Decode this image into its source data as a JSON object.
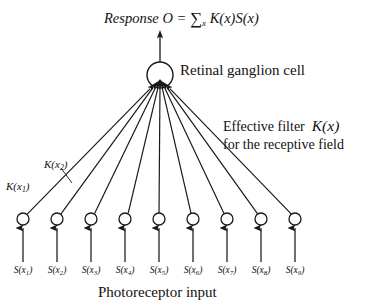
{
  "figure": {
    "title_equation": {
      "prefix": "Response",
      "output_symbol": "O",
      "equals": "=",
      "sum_symbol": "∑",
      "sum_index": "x",
      "kernel": "K(x)",
      "signal": "S(x)",
      "full_text": "Response O = ∑x K(x)S(x)"
    },
    "ganglion_cell_label": "Retinal ganglion cell",
    "effective_filter": {
      "line1_text": "Effective filter",
      "line1_symbol": "K(x)",
      "line2_text": "for the receptive field"
    },
    "weight_labels": [
      {
        "name": "K(x1)",
        "base": "K(x",
        "sub": "1",
        "close": ")"
      },
      {
        "name": "K(x2)",
        "base": "K(x",
        "sub": "2",
        "close": ")"
      }
    ],
    "photoreceptor_input_label": "Photoreceptor input",
    "photoreceptors": [
      {
        "index": 1,
        "label_base": "S(x",
        "label_sub": "1",
        "label_close": ")",
        "label": "S(x1)",
        "cx": 23
      },
      {
        "index": 2,
        "label_base": "S(x",
        "label_sub": "2",
        "label_close": ")",
        "label": "S(x2)",
        "cx": 57
      },
      {
        "index": 3,
        "label_base": "S(x",
        "label_sub": "3",
        "label_close": ")",
        "label": "S(x3)",
        "cx": 91
      },
      {
        "index": 4,
        "label_base": "S(x",
        "label_sub": "4",
        "label_close": ")",
        "label": "S(x4)",
        "cx": 125
      },
      {
        "index": 5,
        "label_base": "S(x",
        "label_sub": "5",
        "label_close": ")",
        "label": "S(x5)",
        "cx": 159
      },
      {
        "index": 6,
        "label_base": "S(x",
        "label_sub": "6",
        "label_close": ")",
        "label": "S(x6)",
        "cx": 193
      },
      {
        "index": 7,
        "label_base": "S(x",
        "label_sub": "7",
        "label_close": ")",
        "label": "S(x7)",
        "cx": 227
      },
      {
        "index": 8,
        "label_base": "S(x",
        "label_sub": "8",
        "label_close": ")",
        "label": "S(x8)",
        "cx": 261
      },
      {
        "index": 9,
        "label_base": "S(x",
        "label_sub": "9",
        "label_close": ")",
        "label": "S(x9)",
        "cx": 295
      }
    ],
    "geometry": {
      "ganglion_center_x": 160,
      "ganglion_center_y": 75,
      "ganglion_radius": 13,
      "output_arrow_top_y": 31,
      "convergence_y": 89,
      "receptor_center_y": 219,
      "receptor_radius": 6,
      "input_stem_bottom_y": 262
    },
    "colors": {
      "background": "#ffffff",
      "ink": "#1a1a1a",
      "stroke": "#222222"
    }
  }
}
